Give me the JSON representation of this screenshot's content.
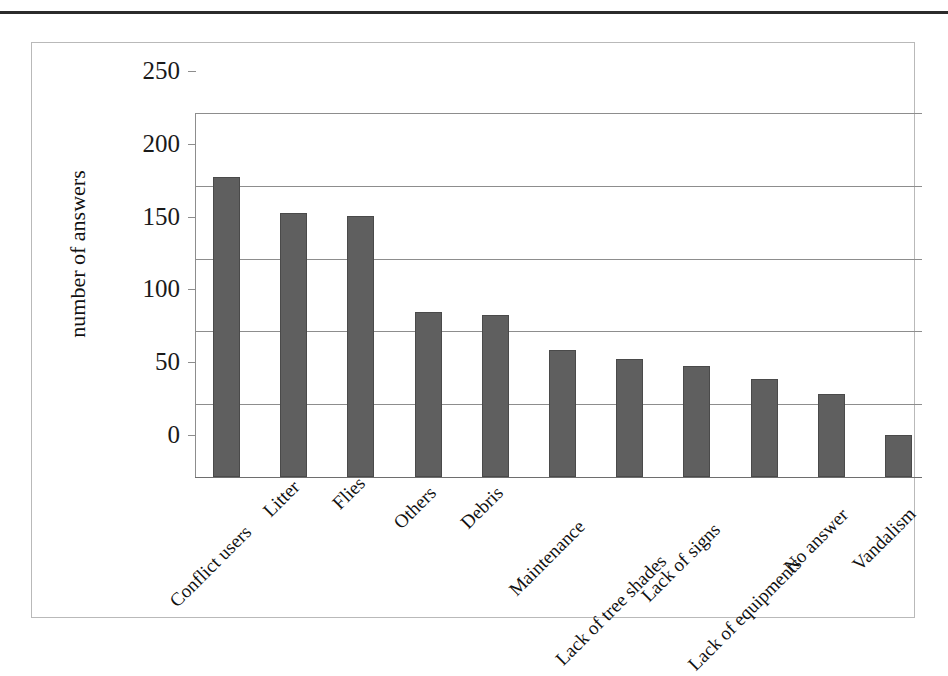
{
  "chart_data": {
    "type": "bar",
    "title": "",
    "subtitle": "",
    "xlabel": "",
    "ylabel": "number of answers",
    "ylim": [
      0,
      250
    ],
    "ytick_labels": [
      "250",
      "200",
      "150",
      "100",
      "50",
      "0"
    ],
    "ytick_values": [
      250,
      200,
      150,
      100,
      50,
      0
    ],
    "grid": true,
    "legend": "none",
    "bar_color": "#5f5f5f",
    "gridline_color": "#8d8d8d",
    "categories": [
      "Conflict users",
      "Litter",
      "Flies",
      "Others",
      "Debris",
      "Maintenance",
      "Lack of tree shades",
      "Lack of signs",
      "Lack of equipments",
      "No answer",
      "Vandalism"
    ],
    "values": [
      206,
      181,
      179,
      113,
      111,
      87,
      81,
      76,
      67,
      57,
      29
    ]
  }
}
